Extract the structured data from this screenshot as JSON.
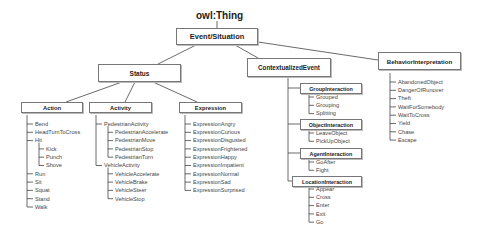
{
  "root": "owl:Thing",
  "top": "Event/Situation",
  "status": {
    "label": "Status",
    "action": {
      "label": "Action",
      "items": [
        "Bend",
        "HeadTurnToCross",
        "Hit",
        "Kick",
        "Punch",
        "Shove",
        "Run",
        "Sit",
        "Squat",
        "Stand",
        "Walk"
      ]
    },
    "activity": {
      "label": "Activity",
      "items": [
        "PedestrianActivity",
        "PedestrianAccelerate",
        "PedestrianMove",
        "PedestrianStop",
        "PedestrianTurn",
        "VehicleActivity",
        "VehicleAccelerate",
        "VehicleBrake",
        "VehicleSteer",
        "VehicleStop"
      ]
    },
    "expression": {
      "label": "Expression",
      "items": [
        "ExpressionAngry",
        "ExpressionCurious",
        "ExpressionDisgusted",
        "ExpressionFrightened",
        "ExpressionHappy",
        "ExpressionImpatient",
        "ExpressionNormal",
        "ExpressionSad",
        "ExpressionSurprised"
      ]
    }
  },
  "contextualized": {
    "label": "ContextualizedEvent",
    "group": {
      "label": "GroupInteraction",
      "items": [
        "Grouped",
        "Grouping",
        "Splitting"
      ]
    },
    "object": {
      "label": "ObjectInteraction",
      "items": [
        "LeaveObject",
        "PickUpObject"
      ]
    },
    "agent": {
      "label": "AgentInteraction",
      "items": [
        "GoAfter",
        "Fight"
      ]
    },
    "location": {
      "label": "LocationInteraction",
      "items": [
        "Appear",
        "Cross",
        "Enter",
        "Exit",
        "Go"
      ]
    }
  },
  "behavior": {
    "label": "BehaviorInterpretation",
    "items": [
      "AbandonedObject",
      "DangerOfRunover",
      "Theft",
      "WaitForSomebody",
      "WaitToCross",
      "Yield",
      "Chase",
      "Escape"
    ]
  }
}
